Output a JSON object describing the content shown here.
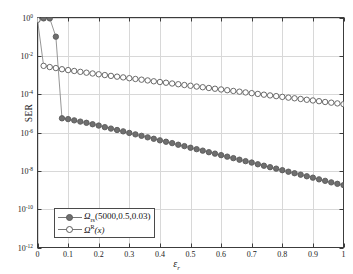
{
  "figure": {
    "ylabel": "SER",
    "xlabel_base": "ε",
    "xlabel_sub": "r"
  },
  "axes": {
    "xticks": [
      "0",
      "0.1",
      "0.2",
      "0.3",
      "0.4",
      "0.5",
      "0.6",
      "0.7",
      "0.8",
      "0.9",
      "1"
    ],
    "yticks": [
      {
        "mantissa": "10",
        "exp": "0"
      },
      {
        "mantissa": "10",
        "exp": "-2"
      },
      {
        "mantissa": "10",
        "exp": "-4"
      },
      {
        "mantissa": "10",
        "exp": "-6"
      },
      {
        "mantissa": "10",
        "exp": "-8"
      },
      {
        "mantissa": "10",
        "exp": "-10"
      },
      {
        "mantissa": "10",
        "exp": "-12"
      }
    ]
  },
  "legend": {
    "entries": [
      {
        "marker": "filled-circle",
        "base": "Ω",
        "sub": "rs",
        "args": "(5000,0.5,0.03)",
        "sup": ""
      },
      {
        "marker": "open-circle",
        "base": "Ω",
        "sub": "",
        "sup": "R",
        "args": "(x)"
      }
    ]
  },
  "style": {
    "line_color": "#8a8a8a",
    "filled_marker_fill": "#6f6f6f",
    "marker_edge": "#5a5a5a",
    "open_marker_fill": "#ffffff",
    "grid_color": "#d8d8d8",
    "axis_color": "#3c3c3c",
    "background": "#ffffff"
  },
  "chart_data": {
    "type": "line",
    "title": "",
    "xlabel": "ε_r",
    "ylabel": "SER",
    "xlim": [
      0,
      1
    ],
    "ylim": [
      1e-12,
      1
    ],
    "yscale": "log",
    "xscale": "linear",
    "grid": true,
    "legend_position": "lower-left",
    "xticks": [
      0,
      0.1,
      0.2,
      0.3,
      0.4,
      0.5,
      0.6,
      0.7,
      0.8,
      0.9,
      1
    ],
    "yticks": [
      1.0,
      0.01,
      0.0001,
      1e-06,
      1e-08,
      1e-10,
      1e-12
    ],
    "series": [
      {
        "name": "Ω_rs(5000,0.5,0.03)",
        "marker": "filled-circle",
        "x": [
          0.0,
          0.02,
          0.04,
          0.06,
          0.08,
          0.1,
          0.12,
          0.14,
          0.16,
          0.18,
          0.2,
          0.22,
          0.24,
          0.26,
          0.28,
          0.3,
          0.32,
          0.34,
          0.36,
          0.38,
          0.4,
          0.42,
          0.44,
          0.46,
          0.48,
          0.5,
          0.52,
          0.54,
          0.56,
          0.58,
          0.6,
          0.62,
          0.64,
          0.66,
          0.68,
          0.7,
          0.72,
          0.74,
          0.76,
          0.78,
          0.8,
          0.82,
          0.84,
          0.86,
          0.88,
          0.9,
          0.92,
          0.94,
          0.96,
          0.98,
          1.0
        ],
        "y": [
          0.8,
          0.9,
          0.9,
          0.1,
          5.5e-06,
          5e-06,
          4.3e-06,
          3.7e-06,
          3.2e-06,
          2.7e-06,
          2.3e-06,
          1.9e-06,
          1.6e-06,
          1.35e-06,
          1.15e-06,
          9.5e-07,
          8e-07,
          6.7e-07,
          5.6e-07,
          4.7e-07,
          3.9e-07,
          3.3e-07,
          2.8e-07,
          2.3e-07,
          1.95e-07,
          1.6e-07,
          1.35e-07,
          1.13e-07,
          9.4e-08,
          7.9e-08,
          6.6e-08,
          5.5e-08,
          4.6e-08,
          3.8e-08,
          3.2e-08,
          2.7e-08,
          2.2e-08,
          1.85e-08,
          1.55e-08,
          1.3e-08,
          1.08e-08,
          9e-09,
          7.5e-09,
          6.3e-09,
          5.2e-09,
          4.4e-09,
          3.6e-09,
          3e-09,
          2.5e-09,
          2.1e-09,
          1.8e-09
        ]
      },
      {
        "name": "Ω^R(x)",
        "marker": "open-circle",
        "x": [
          0.0,
          0.02,
          0.04,
          0.06,
          0.08,
          0.1,
          0.12,
          0.14,
          0.16,
          0.18,
          0.2,
          0.22,
          0.24,
          0.26,
          0.28,
          0.3,
          0.32,
          0.34,
          0.36,
          0.38,
          0.4,
          0.42,
          0.44,
          0.46,
          0.48,
          0.5,
          0.52,
          0.54,
          0.56,
          0.58,
          0.6,
          0.62,
          0.64,
          0.66,
          0.68,
          0.7,
          0.72,
          0.74,
          0.76,
          0.78,
          0.8,
          0.82,
          0.84,
          0.86,
          0.88,
          0.9,
          0.92,
          0.94,
          0.96,
          0.98,
          1.0
        ],
        "y": [
          0.75,
          0.003,
          0.0026,
          0.0023,
          0.002,
          0.0018,
          0.00162,
          0.00146,
          0.00132,
          0.0012,
          0.00109,
          0.00099,
          0.0009,
          0.00082,
          0.00075,
          0.00068,
          0.00062,
          0.00057,
          0.00052,
          0.00047,
          0.00043,
          0.000395,
          0.00036,
          0.00033,
          0.0003,
          0.000275,
          0.00025,
          0.00023,
          0.00021,
          0.000192,
          0.000176,
          0.000161,
          0.000147,
          0.000135,
          0.000123,
          0.000113,
          0.000103,
          9.4e-05,
          8.6e-05,
          7.9e-05,
          7.2e-05,
          6.6e-05,
          6.1e-05,
          5.6e-05,
          5.1e-05,
          4.7e-05,
          4.3e-05,
          3.9e-05,
          3.6e-05,
          3.3e-05,
          3e-05
        ]
      }
    ]
  }
}
